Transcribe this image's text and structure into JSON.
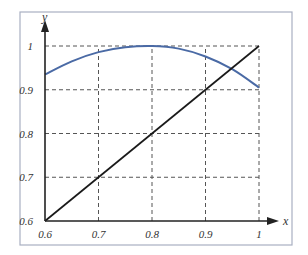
{
  "chart_data": {
    "type": "line",
    "title": "",
    "xlabel": "x",
    "ylabel": "y",
    "xlim": [
      0.6,
      1.0
    ],
    "ylim": [
      0.6,
      1.0
    ],
    "grid": true,
    "grid_style": "dashed",
    "legend": null,
    "x_ticks": [
      "0.6",
      "0.7",
      "0.8",
      "0.9",
      "1"
    ],
    "y_ticks": [
      "0.6",
      "0.7",
      "0.8",
      "0.9",
      "1"
    ],
    "series": [
      {
        "name": "curve",
        "color": "#4a6aa5",
        "x": [
          0.6,
          0.65,
          0.7,
          0.75,
          0.8,
          0.85,
          0.9,
          0.95,
          1.0
        ],
        "y": [
          0.935,
          0.965,
          0.986,
          0.997,
          1.0,
          0.994,
          0.976,
          0.947,
          0.905
        ]
      },
      {
        "name": "y = x",
        "color": "#1a1a1a",
        "x": [
          0.6,
          1.0
        ],
        "y": [
          0.6,
          1.0
        ]
      }
    ],
    "annotations": []
  },
  "colors": {
    "frame": "#a9b0c2",
    "axis": "#222222",
    "grid": "#555555",
    "curve": "#4a6aa5",
    "diagonal": "#1a1a1a"
  }
}
